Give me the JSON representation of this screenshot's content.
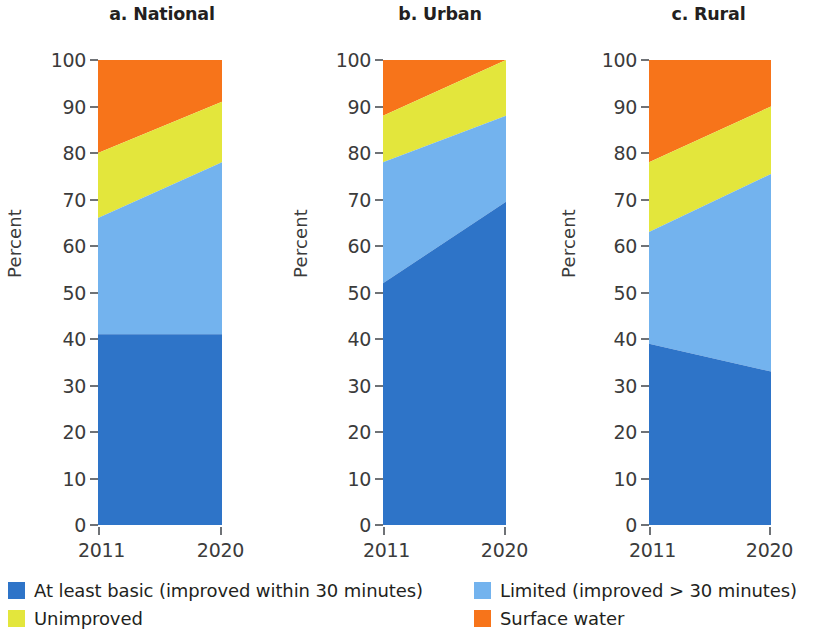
{
  "axis": {
    "ylabel": "Percent",
    "yticks": [
      0,
      10,
      20,
      30,
      40,
      50,
      60,
      70,
      80,
      90,
      100
    ],
    "xticks": [
      "2011",
      "2020"
    ]
  },
  "panels": [
    {
      "title": "a. National"
    },
    {
      "title": "b. Urban"
    },
    {
      "title": "c. Rural"
    }
  ],
  "legend": {
    "items": [
      {
        "label": "At least basic (improved within 30 minutes)",
        "color": "#2E74C8"
      },
      {
        "label": "Unimproved",
        "color": "#E3E63C"
      },
      {
        "label": "Limited (improved > 30 minutes)",
        "color": "#73B3EE"
      },
      {
        "label": "Surface water",
        "color": "#F7741A"
      }
    ]
  },
  "colors": {
    "at_least_basic": "#2E74C8",
    "limited": "#73B3EE",
    "unimproved": "#E3E63C",
    "surface_water": "#F7741A",
    "axis": "#6f7276",
    "text": "#231f20"
  },
  "chart_data": {
    "type": "area",
    "xlabel": "",
    "ylabel": "Percent",
    "ylim": [
      0,
      100
    ],
    "x": [
      2011,
      2020
    ],
    "xtick_labels": [
      "2011",
      "2020"
    ],
    "grid": false,
    "legend_position": "bottom",
    "stacked": true,
    "panels": [
      {
        "key": "national",
        "title": "a. National",
        "series": [
          {
            "name": "At least basic (improved within 30 minutes)",
            "color": "#2E74C8",
            "values": [
              41,
              41
            ]
          },
          {
            "name": "Limited (improved > 30 minutes)",
            "color": "#73B3EE",
            "values": [
              25,
              37
            ]
          },
          {
            "name": "Unimproved",
            "color": "#E3E63C",
            "values": [
              14,
              13
            ]
          },
          {
            "name": "Surface water",
            "color": "#F7741A",
            "values": [
              20,
              9
            ]
          }
        ],
        "cumulative_boundaries": {
          "at_least_basic_top": [
            41,
            41
          ],
          "limited_top": [
            66,
            78
          ],
          "unimproved_top": [
            80,
            91
          ],
          "surface_water_top": [
            100,
            100
          ]
        }
      },
      {
        "key": "urban",
        "title": "b. Urban",
        "series": [
          {
            "name": "At least basic (improved within 30 minutes)",
            "color": "#2E74C8",
            "values": [
              52,
              69.5
            ]
          },
          {
            "name": "Limited (improved > 30 minutes)",
            "color": "#73B3EE",
            "values": [
              26,
              18.5
            ]
          },
          {
            "name": "Unimproved",
            "color": "#E3E63C",
            "values": [
              10,
              12
            ]
          },
          {
            "name": "Surface water",
            "color": "#F7741A",
            "values": [
              12,
              0
            ]
          }
        ],
        "cumulative_boundaries": {
          "at_least_basic_top": [
            52,
            69.5
          ],
          "limited_top": [
            78,
            88
          ],
          "unimproved_top": [
            88,
            100
          ],
          "surface_water_top": [
            100,
            100
          ]
        }
      },
      {
        "key": "rural",
        "title": "c. Rural",
        "series": [
          {
            "name": "At least basic (improved within 30 minutes)",
            "color": "#2E74C8",
            "values": [
              39,
              33
            ]
          },
          {
            "name": "Limited (improved > 30 minutes)",
            "color": "#73B3EE",
            "values": [
              24,
              42.5
            ]
          },
          {
            "name": "Unimproved",
            "color": "#E3E63C",
            "values": [
              15,
              14.5
            ]
          },
          {
            "name": "Surface water",
            "color": "#F7741A",
            "values": [
              22,
              10
            ]
          }
        ],
        "cumulative_boundaries": {
          "at_least_basic_top": [
            39,
            33
          ],
          "limited_top": [
            63,
            75.5
          ],
          "unimproved_top": [
            78,
            90
          ],
          "surface_water_top": [
            100,
            100
          ]
        }
      }
    ]
  }
}
